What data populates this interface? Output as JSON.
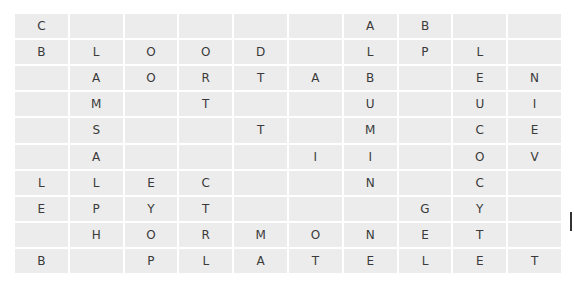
{
  "puzzle": {
    "type": "word-grid",
    "rows": 10,
    "cols": 10,
    "cell_color": "#ececec",
    "letter_color": "#3a3a3a",
    "grid": [
      [
        "C",
        "",
        "",
        "",
        "",
        "",
        "A",
        "B",
        "",
        ""
      ],
      [
        "B",
        "L",
        "O",
        "O",
        "D",
        "",
        "L",
        "P",
        "L",
        ""
      ],
      [
        "",
        "A",
        "O",
        "R",
        "T",
        "A",
        "B",
        "",
        "E",
        "N"
      ],
      [
        "",
        "M",
        "",
        "T",
        "",
        "",
        "U",
        "",
        "U",
        "I"
      ],
      [
        "",
        "S",
        "",
        "",
        "T",
        "",
        "M",
        "",
        "C",
        "E"
      ],
      [
        "",
        "A",
        "",
        "",
        "",
        "I",
        "I",
        "",
        "O",
        "V"
      ],
      [
        "L",
        "L",
        "E",
        "C",
        "",
        "",
        "N",
        "",
        "C",
        ""
      ],
      [
        "E",
        "P",
        "Y",
        "T",
        "",
        "",
        "",
        "G",
        "Y",
        ""
      ],
      [
        "",
        "H",
        "O",
        "R",
        "M",
        "O",
        "N",
        "E",
        "T",
        ""
      ],
      [
        "B",
        "",
        "P",
        "L",
        "A",
        "T",
        "E",
        "L",
        "E",
        "T"
      ]
    ]
  }
}
